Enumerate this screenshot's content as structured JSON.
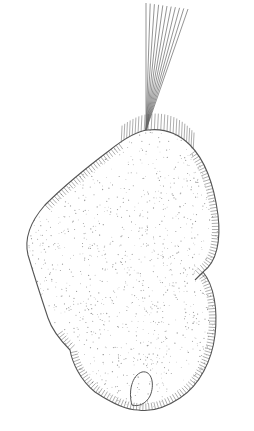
{
  "figure": {
    "colors": {
      "background": "#ffffff",
      "outline": "#555555",
      "cilia": "#777777",
      "stipple": "#9a9a9a",
      "tuft": "#666666"
    },
    "parts": {
      "body": "cell-body-outline",
      "tuft": "apical-cilia-tuft",
      "cilia": "somatic-cilia",
      "vacuole": "contractile-vacuole"
    }
  }
}
